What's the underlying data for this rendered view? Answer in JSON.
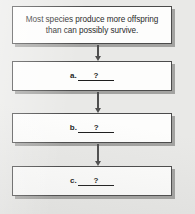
{
  "figure": {
    "type": "flowchart",
    "orientation": "vertical",
    "background_color": "#e9e9e7",
    "box_fill_color": "#fdfdfc",
    "box_border_color": "#4b4b4b",
    "shadow_color": "#787876",
    "arrow_color": "#4f4f4f"
  },
  "nodes": [
    {
      "id": "statement",
      "line1": "Most species produce more offspring",
      "line2": "than can possibly survive."
    },
    {
      "id": "blank-a",
      "letter": "a.",
      "blank": "?"
    },
    {
      "id": "blank-b",
      "letter": "b.",
      "blank": "?"
    },
    {
      "id": "blank-c",
      "letter": "c.",
      "blank": "?"
    }
  ],
  "connectors": [
    {
      "id": "connector-1",
      "from": "statement",
      "to": "blank-a",
      "glyph": "down-arrow"
    },
    {
      "id": "connector-2",
      "from": "blank-a",
      "to": "blank-b",
      "glyph": "down-arrow"
    },
    {
      "id": "connector-3",
      "from": "blank-b",
      "to": "blank-c",
      "glyph": "down-arrow"
    }
  ]
}
